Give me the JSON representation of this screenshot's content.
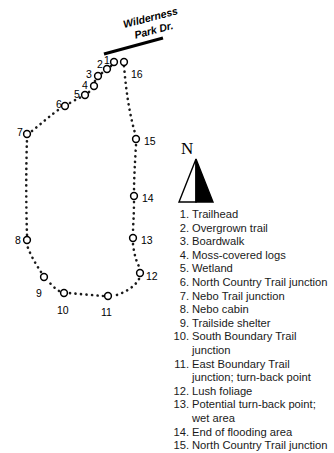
{
  "figure": {
    "background_color": "#ffffff",
    "ink_color": "#000000"
  },
  "road": {
    "name": "road-wilderness-park-dr",
    "label_line_1": "Wilderness",
    "label_line_2": "Park Dr.",
    "color": "#000000"
  },
  "compass": {
    "label": "N",
    "name": "north-arrow"
  },
  "map_points": [
    {
      "id": 1,
      "label": "1",
      "x": 114,
      "y": 62,
      "label_x": 104,
      "label_y": 55
    },
    {
      "id": 2,
      "label": "2",
      "x": 107,
      "y": 69,
      "label_x": 97,
      "label_y": 59
    },
    {
      "id": 3,
      "label": "3",
      "x": 98,
      "y": 76,
      "label_x": 86,
      "label_y": 69
    },
    {
      "id": 4,
      "label": "4",
      "x": 94,
      "y": 86,
      "label_x": 82,
      "label_y": 80
    },
    {
      "id": 5,
      "label": "5",
      "x": 85,
      "y": 95,
      "label_x": 74,
      "label_y": 89
    },
    {
      "id": 6,
      "label": "6",
      "x": 65,
      "y": 106,
      "label_x": 56,
      "label_y": 99
    },
    {
      "id": 7,
      "label": "7",
      "x": 27,
      "y": 134,
      "label_x": 17,
      "label_y": 127
    },
    {
      "id": 8,
      "label": "8",
      "x": 27,
      "y": 240,
      "label_x": 15,
      "label_y": 235
    },
    {
      "id": 9,
      "label": "9",
      "x": 44,
      "y": 277,
      "label_x": 36,
      "label_y": 288
    },
    {
      "id": 10,
      "label": "10",
      "x": 64,
      "y": 293,
      "label_x": 57,
      "label_y": 305
    },
    {
      "id": 11,
      "label": "11",
      "x": 108,
      "y": 296,
      "label_x": 101,
      "label_y": 307
    },
    {
      "id": 12,
      "label": "12",
      "x": 140,
      "y": 273,
      "label_x": 146,
      "label_y": 271
    },
    {
      "id": 13,
      "label": "13",
      "x": 133,
      "y": 238,
      "label_x": 141,
      "label_y": 235
    },
    {
      "id": 14,
      "label": "14",
      "x": 134,
      "y": 196,
      "label_x": 142,
      "label_y": 193
    },
    {
      "id": 15,
      "label": "15",
      "x": 136,
      "y": 139,
      "label_x": 144,
      "label_y": 136
    },
    {
      "id": 16,
      "label": "16",
      "x": 124,
      "y": 62,
      "label_x": 131,
      "label_y": 69
    }
  ],
  "legend": {
    "name": "trail-feature-legend",
    "items": [
      {
        "num": "1.",
        "text": "Trailhead"
      },
      {
        "num": "2.",
        "text": "Overgrown trail"
      },
      {
        "num": "3.",
        "text": "Boardwalk"
      },
      {
        "num": "4.",
        "text": "Moss-covered logs"
      },
      {
        "num": "5.",
        "text": "Wetland"
      },
      {
        "num": "6.",
        "text": "North Country Trail junction"
      },
      {
        "num": "7.",
        "text": "Nebo Trail junction"
      },
      {
        "num": "8.",
        "text": "Nebo cabin"
      },
      {
        "num": "9.",
        "text": "Trailside shelter"
      },
      {
        "num": "10.",
        "text": "South Boundary Trail junction"
      },
      {
        "num": "11.",
        "text": "East Boundary Trail junction; turn-back point"
      },
      {
        "num": "12.",
        "text": "Lush foliage"
      },
      {
        "num": "13.",
        "text": "Potential turn-back point; wet area"
      },
      {
        "num": "14.",
        "text": "End of flooding area"
      },
      {
        "num": "15.",
        "text": "North Country Trail junction"
      }
    ]
  }
}
